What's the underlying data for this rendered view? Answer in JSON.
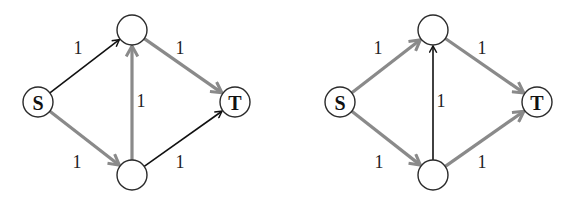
{
  "colors": {
    "black_edge": "#111111",
    "gray_edge": "#8a8a8a",
    "node_stroke": "#2a2a2a",
    "background": "#ffffff"
  },
  "graphs": [
    {
      "id": "left",
      "nodes": [
        {
          "id": "S",
          "label": "S",
          "x": 38,
          "y": 102
        },
        {
          "id": "A",
          "label": "",
          "x": 132,
          "y": 30
        },
        {
          "id": "B",
          "label": "",
          "x": 132,
          "y": 175
        },
        {
          "id": "T",
          "label": "T",
          "x": 235,
          "y": 102
        }
      ],
      "edges": [
        {
          "from": "S",
          "to": "A",
          "capacity": "1",
          "color": "black",
          "label_x": 78,
          "label_y": 48
        },
        {
          "from": "S",
          "to": "B",
          "capacity": "1",
          "color": "gray",
          "label_x": 77,
          "label_y": 162
        },
        {
          "from": "B",
          "to": "A",
          "capacity": "1",
          "color": "gray",
          "label_x": 141,
          "label_y": 101
        },
        {
          "from": "A",
          "to": "T",
          "capacity": "1",
          "color": "gray",
          "label_x": 180,
          "label_y": 48
        },
        {
          "from": "B",
          "to": "T",
          "capacity": "1",
          "color": "black",
          "label_x": 180,
          "label_y": 162
        }
      ]
    },
    {
      "id": "right",
      "nodes": [
        {
          "id": "S",
          "label": "S",
          "x": 340,
          "y": 102
        },
        {
          "id": "A",
          "label": "",
          "x": 433,
          "y": 30
        },
        {
          "id": "B",
          "label": "",
          "x": 433,
          "y": 175
        },
        {
          "id": "T",
          "label": "T",
          "x": 537,
          "y": 102
        }
      ],
      "edges": [
        {
          "from": "S",
          "to": "A",
          "capacity": "1",
          "color": "gray",
          "label_x": 378,
          "label_y": 48
        },
        {
          "from": "S",
          "to": "B",
          "capacity": "1",
          "color": "gray",
          "label_x": 379,
          "label_y": 162
        },
        {
          "from": "B",
          "to": "A",
          "capacity": "1",
          "color": "black",
          "label_x": 441,
          "label_y": 101
        },
        {
          "from": "A",
          "to": "T",
          "capacity": "1",
          "color": "gray",
          "label_x": 482,
          "label_y": 48
        },
        {
          "from": "B",
          "to": "T",
          "capacity": "1",
          "color": "gray",
          "label_x": 482,
          "label_y": 162
        }
      ]
    }
  ]
}
